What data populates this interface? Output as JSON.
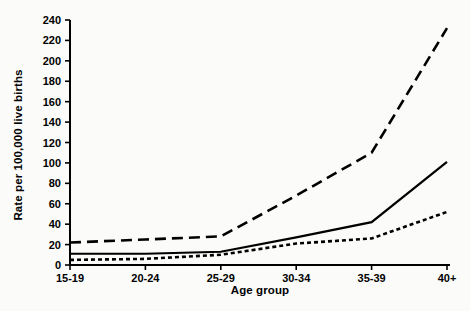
{
  "chart_data": {
    "type": "line",
    "title": "",
    "xlabel": "Age group",
    "ylabel": "Rate per 100,000 live births",
    "categories": [
      "15-19",
      "20-24",
      "25-29",
      "30-34",
      "35-39",
      "40+"
    ],
    "ylim": [
      0,
      240
    ],
    "ytick_labels": [
      "0",
      "20",
      "40",
      "60",
      "80",
      "100",
      "120",
      "140",
      "160",
      "180",
      "200",
      "220",
      "240"
    ],
    "ytick_values": [
      0,
      20,
      40,
      60,
      80,
      100,
      120,
      140,
      160,
      180,
      200,
      220,
      240
    ],
    "grid": false,
    "legend": "none",
    "series": [
      {
        "name": "long-dashed-series",
        "style": "long-dashed",
        "color": "#000000",
        "values": [
          22,
          25,
          28,
          68,
          110,
          232
        ]
      },
      {
        "name": "solid-series",
        "style": "solid",
        "color": "#000000",
        "values": [
          11,
          11,
          13,
          27,
          42,
          101
        ]
      },
      {
        "name": "short-dotted-series",
        "style": "short-dotted",
        "color": "#000000",
        "values": [
          5,
          6,
          10,
          21,
          26,
          52
        ]
      }
    ]
  },
  "axes": {
    "x_axis_name": "x-axis",
    "y_axis_name": "y-axis"
  }
}
